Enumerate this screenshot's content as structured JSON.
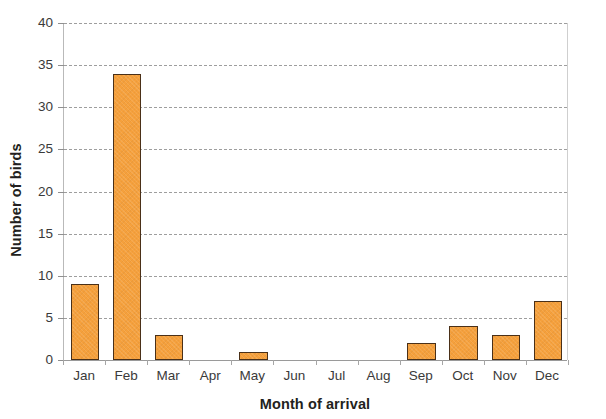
{
  "chart_data": {
    "type": "bar",
    "title": "",
    "subtitle": "",
    "xlabel": "Month of arrival",
    "ylabel": "Number of birds",
    "categories": [
      "Jan",
      "Feb",
      "Mar",
      "Apr",
      "May",
      "Jun",
      "Jul",
      "Aug",
      "Sep",
      "Oct",
      "Nov",
      "Dec"
    ],
    "values": [
      9,
      34,
      3,
      0,
      1,
      0,
      0,
      0,
      2,
      4,
      3,
      7
    ],
    "ylim": [
      0,
      40
    ],
    "ytick_labels": [
      "0",
      "5",
      "10",
      "15",
      "20",
      "25",
      "30",
      "35",
      "40"
    ],
    "ytick_values": [
      0,
      5,
      10,
      15,
      20,
      25,
      30,
      35,
      40
    ],
    "ytick_interval": 5,
    "grid": "horizontal-dashed",
    "legend": "none",
    "bar_fill_color": "#F5A03C",
    "bar_border_color": "#4A3018",
    "gridline_color": "#8E8E8E",
    "axis_color": "#B9B9B9",
    "background_color": "#FFFFFF",
    "text_color": "#333333"
  }
}
